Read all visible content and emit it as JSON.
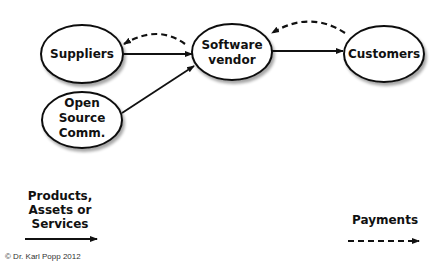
{
  "nodes": {
    "suppliers": {
      "label": "Suppliers"
    },
    "open_source": {
      "lines": [
        "Open",
        "Source",
        "Comm."
      ]
    },
    "vendor": {
      "lines": [
        "Software",
        "vendor"
      ]
    },
    "customers": {
      "label": "Customers"
    }
  },
  "edges": [
    {
      "from": "Suppliers",
      "to": "Software vendor",
      "type": "solid",
      "meaning": "Products, Assets or Services"
    },
    {
      "from": "Open Source Comm.",
      "to": "Software vendor",
      "type": "solid",
      "meaning": "Products, Assets or Services"
    },
    {
      "from": "Software vendor",
      "to": "Customers",
      "type": "solid",
      "meaning": "Products, Assets or Services"
    },
    {
      "from": "Software vendor",
      "to": "Suppliers",
      "type": "dashed",
      "meaning": "Payments"
    },
    {
      "from": "Customers",
      "to": "Software vendor",
      "type": "dashed",
      "meaning": "Payments"
    }
  ],
  "legend": {
    "solid": {
      "lines": [
        "Products,",
        "Assets or",
        "Services"
      ]
    },
    "dashed": {
      "label": "Payments"
    }
  },
  "copyright": "© Dr. Karl Popp 2012"
}
